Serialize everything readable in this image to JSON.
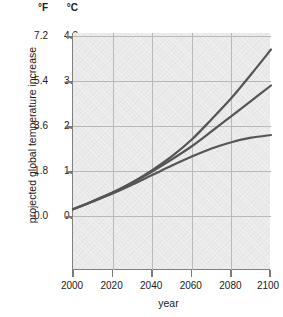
{
  "chart_data": {
    "type": "line",
    "title": "",
    "xlabel": "year",
    "ylabel": "projected global temperature increase",
    "x": [
      2000,
      2010,
      2020,
      2030,
      2040,
      2050,
      2060,
      2070,
      2080,
      2090,
      2100
    ],
    "xlim": [
      2000,
      2100
    ],
    "ylim": [
      0.0,
      4.0
    ],
    "y_unit_primary": "°C",
    "y_unit_secondary": "°F",
    "grid": true,
    "legend": "none",
    "series": [
      {
        "name": "high-scenario",
        "color": "#555555",
        "values": [
          0.15,
          0.33,
          0.52,
          0.75,
          1.02,
          1.33,
          1.7,
          2.15,
          2.62,
          3.15,
          3.7
        ]
      },
      {
        "name": "mid-scenario",
        "color": "#555555",
        "values": [
          0.15,
          0.33,
          0.52,
          0.74,
          0.99,
          1.26,
          1.55,
          1.88,
          2.22,
          2.56,
          2.9
        ]
      },
      {
        "name": "low-scenario",
        "color": "#555555",
        "values": [
          0.15,
          0.32,
          0.5,
          0.7,
          0.91,
          1.12,
          1.32,
          1.5,
          1.64,
          1.74,
          1.8
        ]
      }
    ]
  },
  "axes": {
    "unit_header_fahrenheit": "°F",
    "unit_header_celsius": "°C",
    "y_title": "projected global temperature increase",
    "x_title": "year",
    "y_ticks_fahrenheit": [
      "7.2",
      "5.4",
      "3.6",
      "1.8",
      "0.0"
    ],
    "y_ticks_celsius": [
      "4.0",
      "3.0",
      "2.0",
      "1.0",
      "0.0"
    ],
    "x_ticks": [
      "2000",
      "2020",
      "2040",
      "2060",
      "2080",
      "2100"
    ]
  },
  "style": {
    "plot_background": "#e9e9e9",
    "grid_color": "#b9b9b9",
    "axis_color": "#808080",
    "curve_color": "#555555"
  }
}
